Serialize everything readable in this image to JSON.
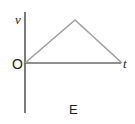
{
  "diagram": {
    "axis_y_label": "v",
    "axis_x_label": "t",
    "origin_label": "O",
    "caption": "E",
    "curve": {
      "type": "triangle",
      "points": [
        [
          0,
          0
        ],
        [
          0.5,
          1
        ],
        [
          1,
          0
        ]
      ],
      "color": "#a0a0a0"
    },
    "axis_color": "#222222"
  }
}
